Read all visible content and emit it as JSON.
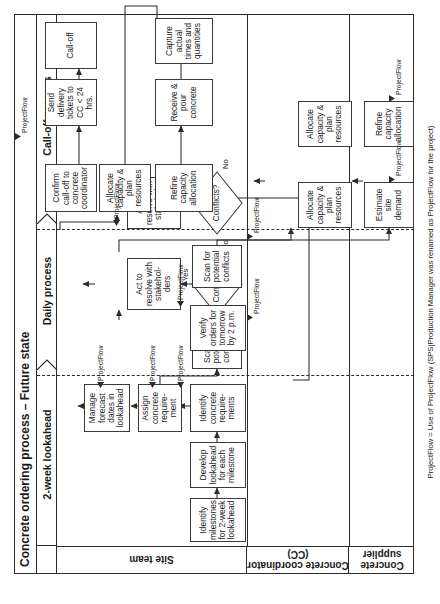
{
  "diagram": {
    "title": "Concrete ordering process – Future state",
    "footnote": "ProjectFlow = Use of ProjectFlow (SPS|Production Manager was renamed as ProjectFlow for the project)",
    "annotation_label": "ProjectFlow",
    "phases": [
      {
        "id": "lookahead",
        "label": "2-week lookahead"
      },
      {
        "id": "daily",
        "label": "Daily process"
      },
      {
        "id": "calloff",
        "label": "Call-off process"
      }
    ],
    "lanes": [
      {
        "id": "site",
        "label": "Site team"
      },
      {
        "id": "cc",
        "label": "Concrete coordinator\n(CC)"
      },
      {
        "id": "supplier",
        "label": "Concrete supplier"
      }
    ],
    "edge_labels": {
      "yes": "Yes",
      "no": "No"
    },
    "nodes": [
      {
        "id": "n1",
        "lane": "site",
        "phase": "lookahead",
        "text": "Identify milestones for 2-week lookahead"
      },
      {
        "id": "n2",
        "lane": "site",
        "phase": "lookahead",
        "text": "Develop lookahead for each milestone"
      },
      {
        "id": "n3",
        "lane": "site",
        "phase": "lookahead",
        "text": "Identify concrete require-ments"
      },
      {
        "id": "n4",
        "lane": "site",
        "phase": "lookahead",
        "text": "Assign concrete require-ment"
      },
      {
        "id": "n5",
        "lane": "site",
        "phase": "lookahead",
        "text": "Manage forecast dates in lookahead"
      },
      {
        "id": "n6",
        "lane": "cc",
        "phase": "lookahead",
        "text": "Scan for potential conflicts"
      },
      {
        "id": "d1",
        "lane": "cc",
        "phase": "lookahead",
        "text": "Conflicts?",
        "shape": "diamond"
      },
      {
        "id": "n7",
        "lane": "cc",
        "phase": "lookahead",
        "text": "Act to resolve with stakehol-ders"
      },
      {
        "id": "n8",
        "lane": "supplier",
        "phase": "lookahead",
        "text": "Estimate site demand"
      },
      {
        "id": "n9",
        "lane": "supplier",
        "phase": "lookahead",
        "text": "Allocate capacity & plan resources"
      },
      {
        "id": "n10",
        "lane": "site",
        "phase": "daily",
        "text": "Verify orders for tomorrow by 2 p.m."
      },
      {
        "id": "n11",
        "lane": "cc",
        "phase": "daily",
        "text": "Scan for potential conflicts"
      },
      {
        "id": "d2",
        "lane": "cc",
        "phase": "daily",
        "text": "Conflicts?",
        "shape": "diamond"
      },
      {
        "id": "n12",
        "lane": "cc",
        "phase": "daily",
        "text": "Act to resolve with stakehol-ders"
      },
      {
        "id": "n13",
        "lane": "supplier",
        "phase": "daily",
        "text": "Refine capacity allocation"
      },
      {
        "id": "n14",
        "lane": "supplier",
        "phase": "daily",
        "text": "Allocate capacity & plan resources"
      },
      {
        "id": "n15",
        "lane": "site",
        "phase": "calloff",
        "text": "Confirm call-off to concrete coordinator"
      },
      {
        "id": "n16",
        "lane": "site",
        "phase": "calloff",
        "text": "Receive & pour concrete"
      },
      {
        "id": "n17",
        "lane": "site",
        "phase": "calloff",
        "text": "Send delivery tickets to CC < 24 hrs."
      },
      {
        "id": "n18",
        "lane": "cc",
        "phase": "calloff",
        "text": "Call-off"
      },
      {
        "id": "n19",
        "lane": "cc",
        "phase": "calloff",
        "text": "Capture actual times and quantities"
      },
      {
        "id": "n20",
        "lane": "cc",
        "phase": "calloff",
        "text": "Send tickets to accounting"
      },
      {
        "id": "n21",
        "lane": "supplier",
        "phase": "calloff",
        "text": "Batch and deliver"
      }
    ]
  }
}
